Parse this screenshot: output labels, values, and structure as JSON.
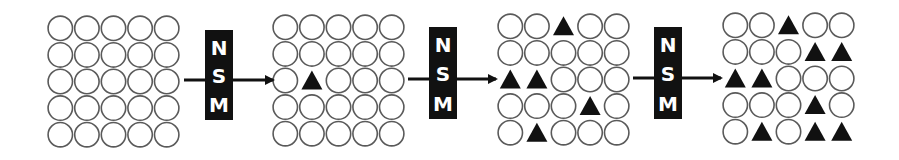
{
  "diagram": {
    "colors": {
      "circle_stroke": "#5a5a5a",
      "triangle_fill": "#111111",
      "box_fill": "#111111",
      "box_text": "#ffffff",
      "arrow": "#111111"
    },
    "grid_size": {
      "rows": 5,
      "cols": 5
    },
    "cell_types": {
      "empty": "circle",
      "marked": "triangle"
    },
    "grids": [
      {
        "name": "grid-step-0",
        "triangles": []
      },
      {
        "name": "grid-step-1",
        "triangles": [
          [
            2,
            1
          ]
        ]
      },
      {
        "name": "grid-step-2",
        "triangles": [
          [
            0,
            2
          ],
          [
            2,
            0
          ],
          [
            2,
            1
          ],
          [
            3,
            3
          ],
          [
            4,
            1
          ]
        ]
      },
      {
        "name": "grid-step-3",
        "triangles": [
          [
            0,
            2
          ],
          [
            1,
            3
          ],
          [
            1,
            4
          ],
          [
            2,
            0
          ],
          [
            2,
            1
          ],
          [
            3,
            3
          ],
          [
            4,
            1
          ],
          [
            4,
            3
          ],
          [
            4,
            4
          ]
        ]
      }
    ],
    "operators": [
      {
        "letters": [
          "N",
          "S",
          "M"
        ]
      },
      {
        "letters": [
          "N",
          "S",
          "M"
        ]
      },
      {
        "letters": [
          "N",
          "S",
          "M"
        ]
      }
    ]
  }
}
